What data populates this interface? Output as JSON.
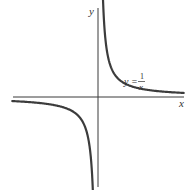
{
  "chart_data": {
    "type": "line",
    "title": "",
    "xlabel": "x",
    "ylabel": "y",
    "grid": false,
    "legend": "none",
    "annotations": [
      {
        "text": "y = 1/x",
        "lhs": "y =",
        "numerator": "1",
        "denominator": "x",
        "position": "upper-right, near positive branch"
      }
    ],
    "series": [
      {
        "name": "y = 1/x (x > 0)",
        "function": "1/x",
        "domain": [
          0.13,
          4.6
        ]
      },
      {
        "name": "y = 1/x (x < 0)",
        "function": "1/x",
        "domain": [
          -4.6,
          -0.13
        ]
      }
    ],
    "xlim": [
      -4.6,
      4.6
    ],
    "ylim": [
      -4.8,
      4.8
    ],
    "asymptotes": {
      "vertical": "x = 0",
      "horizontal": "y = 0"
    },
    "color": "#3c3c3c"
  },
  "labels": {
    "x_axis": "x",
    "y_axis": "y",
    "eq_lhs": "y =",
    "eq_num": "1",
    "eq_den": "x"
  }
}
